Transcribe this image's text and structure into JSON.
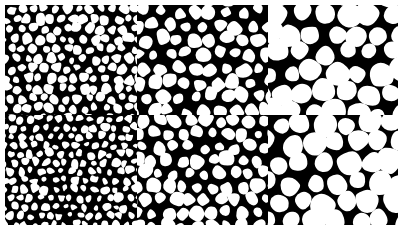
{
  "figure": {
    "background": "#ffffff",
    "cell_color": "#ffffff",
    "matrix_color": "#000000",
    "rows": 2,
    "cols": 3,
    "panels": [
      {
        "id": "top-left",
        "x": 5,
        "y": 5,
        "w": 132,
        "h": 110,
        "cell_size": 9,
        "seed": 11,
        "roundness": 0.55
      },
      {
        "id": "top-middle",
        "x": 137,
        "y": 5,
        "w": 131,
        "h": 110,
        "cell_size": 13,
        "seed": 23,
        "roundness": 0.6
      },
      {
        "id": "top-right",
        "x": 268,
        "y": 5,
        "w": 130,
        "h": 110,
        "cell_size": 18,
        "seed": 37,
        "roundness": 0.85
      },
      {
        "id": "bottom-left",
        "x": 5,
        "y": 115,
        "w": 132,
        "h": 110,
        "cell_size": 8,
        "seed": 41,
        "roundness": 0.45
      },
      {
        "id": "bottom-middle",
        "x": 137,
        "y": 115,
        "w": 131,
        "h": 110,
        "cell_size": 12,
        "seed": 53,
        "roundness": 0.6
      },
      {
        "id": "bottom-right",
        "x": 268,
        "y": 115,
        "w": 130,
        "h": 110,
        "cell_size": 18,
        "seed": 67,
        "roundness": 0.85
      }
    ]
  }
}
